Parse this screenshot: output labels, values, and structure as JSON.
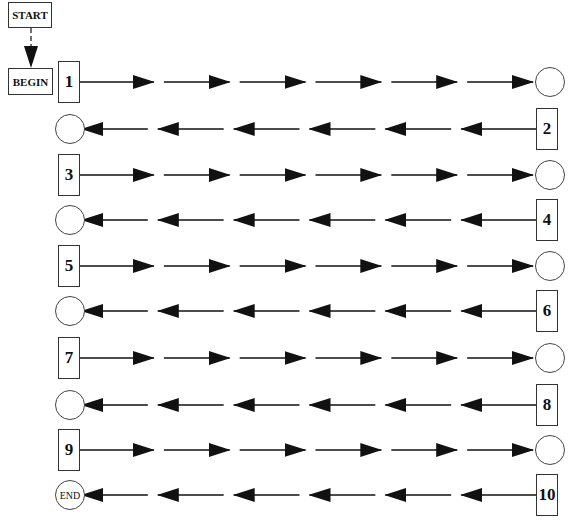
{
  "diagram": {
    "start_label": "START",
    "begin_label": "BEGIN",
    "end_label": "END",
    "connector_start_to_begin": "dashed-arrow-down",
    "rows": [
      {
        "index": 1,
        "label": "1",
        "direction": "right",
        "label_side": "left",
        "terminal": "circle"
      },
      {
        "index": 2,
        "label": "2",
        "direction": "left",
        "label_side": "right",
        "terminal": "circle"
      },
      {
        "index": 3,
        "label": "3",
        "direction": "right",
        "label_side": "left",
        "terminal": "circle"
      },
      {
        "index": 4,
        "label": "4",
        "direction": "left",
        "label_side": "right",
        "terminal": "circle"
      },
      {
        "index": 5,
        "label": "5",
        "direction": "right",
        "label_side": "left",
        "terminal": "circle"
      },
      {
        "index": 6,
        "label": "6",
        "direction": "left",
        "label_side": "right",
        "terminal": "circle"
      },
      {
        "index": 7,
        "label": "7",
        "direction": "right",
        "label_side": "left",
        "terminal": "circle"
      },
      {
        "index": 8,
        "label": "8",
        "direction": "left",
        "label_side": "right",
        "terminal": "circle"
      },
      {
        "index": 9,
        "label": "9",
        "direction": "right",
        "label_side": "left",
        "terminal": "circle"
      },
      {
        "index": 10,
        "label": "10",
        "direction": "left",
        "label_side": "right",
        "terminal": "END"
      }
    ],
    "arrows_per_row": 6,
    "colors": {
      "line": "#111111",
      "box_border": "#333333",
      "background": "#ffffff"
    }
  }
}
